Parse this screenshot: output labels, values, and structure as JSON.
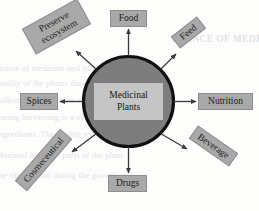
{
  "diagram": {
    "center": {
      "line1": "Medicinal",
      "line2": "Plants"
    },
    "nodes": [
      {
        "id": "food",
        "label": "Food",
        "rotation_deg": 0,
        "position": "top"
      },
      {
        "id": "feed",
        "label": "Feed",
        "rotation_deg": -38,
        "position": "top-right"
      },
      {
        "id": "nutrition",
        "label": "Nutrition",
        "rotation_deg": 0,
        "position": "right"
      },
      {
        "id": "beverage",
        "label": "Beverage",
        "rotation_deg": 35,
        "position": "bottom-right"
      },
      {
        "id": "drugs",
        "label": "Drugs",
        "rotation_deg": 0,
        "position": "bottom"
      },
      {
        "id": "cosmeceutical",
        "label": "Cosmeceutical",
        "rotation_deg": -49,
        "position": "bottom-left"
      },
      {
        "id": "spices",
        "label": "Spices",
        "rotation_deg": 0,
        "position": "left"
      },
      {
        "id": "preserve",
        "label": "Preserve ecosystem",
        "line1": "Preserve",
        "line2": "ecosystem",
        "rotation_deg": -29,
        "position": "top-left"
      }
    ],
    "colors": {
      "node_fill": "#a9a9a9",
      "node_border": "#8e8e8e",
      "circle_fill": "#7d7d7d",
      "circle_border": "#111111",
      "center_fill": "#c5c5c5",
      "arrow": "#3a3a3a",
      "background": "#fdfdfc",
      "text": "#1b1b1b"
    }
  },
  "background_text": {
    "heading": "RTANCE OF MEDICINAL PLANTS",
    "lines": [
      "source of medicine and food, the",
      "quality of the plants during the",
      "collection, cultivation and stor",
      "during harvesting is a very",
      "ingredients. The quality extracts of th",
      "obtained from the parts of the plant",
      "the time period during the growth and"
    ]
  }
}
